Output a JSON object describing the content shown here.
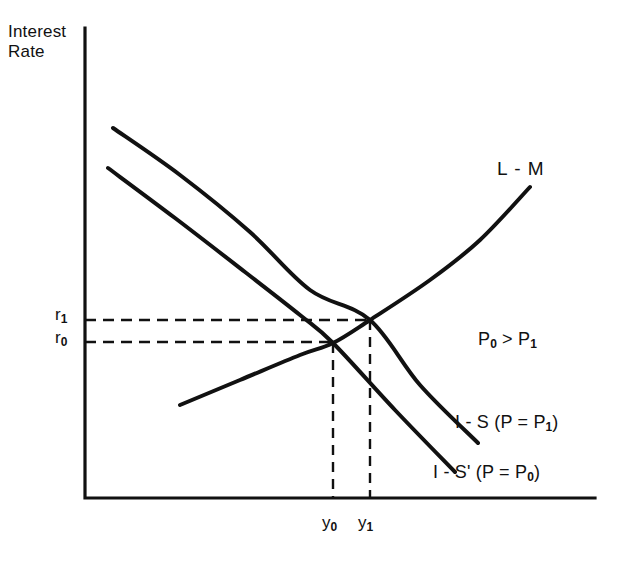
{
  "figure": {
    "background_color": "#ffffff",
    "ink_color": "#111111",
    "width": 619,
    "height": 563
  },
  "axes": {
    "y_axis_label_line1": "Interest",
    "y_axis_label_line2": "Rate",
    "x_axis_label": "",
    "origin": [
      85,
      498
    ],
    "y_axis_top": 28,
    "x_axis_right": 595
  },
  "ticks": {
    "y": [
      {
        "name": "r1",
        "base": "r",
        "sub": "1",
        "value_y_px": 320
      },
      {
        "name": "r0",
        "base": "r",
        "sub": "0",
        "value_y_px": 342
      }
    ],
    "x": [
      {
        "name": "y0",
        "base": "y",
        "sub": "0",
        "value_x_px": 333
      },
      {
        "name": "y1",
        "base": "y",
        "sub": "1",
        "value_x_px": 370
      }
    ]
  },
  "curve_labels": {
    "lm": "L - M",
    "is_p1_prefix": "I - S  (P = P",
    "is_p1_sub": "1",
    "is_p1_suffix": ")",
    "is_p0_prefix": "I - S'  (P = P",
    "is_p0_sub": "0",
    "is_p0_suffix": ")"
  },
  "annotation": {
    "inequality_prefix": "P",
    "inequality_sub_left": "0",
    "inequality_operator": " > P",
    "inequality_sub_right": "1"
  },
  "chart_data": {
    "type": "line",
    "title": "",
    "xlabel": "",
    "ylabel": "Interest Rate",
    "grid": false,
    "legend": "inline-curve-labels",
    "axis_style": "open-L (left and bottom spines only, no tick numbers)",
    "units": "schematic / unlabeled axes",
    "xlim_px": [
      85,
      595
    ],
    "ylim_px": [
      498,
      28
    ],
    "series": [
      {
        "name": "I - S (P = P1)",
        "label": "I-S (P=P₁)",
        "description": "downward-sloping IS schedule for the lower price level P1, lying above and to the right of I-S'",
        "points_px": [
          [
            113,
            128
          ],
          [
            180,
            175
          ],
          [
            250,
            232
          ],
          [
            310,
            290
          ],
          [
            370,
            320
          ],
          [
            420,
            385
          ],
          [
            478,
            443
          ]
        ],
        "stroke_width": 4
      },
      {
        "name": "I - S' (P = P0)",
        "label": "I-S' (P=P₀)",
        "description": "downward-sloping IS schedule for the higher price level P0, lying below and to the left of I-S",
        "points_px": [
          [
            108,
            168
          ],
          [
            175,
            218
          ],
          [
            245,
            272
          ],
          [
            300,
            315
          ],
          [
            333,
            343
          ],
          [
            395,
            410
          ],
          [
            455,
            472
          ]
        ],
        "stroke_width": 4
      },
      {
        "name": "L - M",
        "label": "L-M",
        "description": "upward-sloping LM schedule, steepening as income rises",
        "points_px": [
          [
            180,
            405
          ],
          [
            240,
            380
          ],
          [
            300,
            355
          ],
          [
            333,
            343
          ],
          [
            370,
            320
          ],
          [
            430,
            280
          ],
          [
            480,
            240
          ],
          [
            530,
            187
          ]
        ],
        "stroke_width": 4
      }
    ],
    "equilibria": [
      {
        "name": "E0",
        "x_px": 333,
        "y_px": 343,
        "x_label": "y₀",
        "y_label": "r₀",
        "curves": [
          "I - S' (P = P0)",
          "L - M"
        ]
      },
      {
        "name": "E1",
        "x_px": 370,
        "y_px": 320,
        "x_label": "y₁",
        "y_label": "r₁",
        "curves": [
          "I - S (P = P1)",
          "L - M"
        ]
      }
    ],
    "guide_lines": [
      {
        "orientation": "horizontal",
        "from_px": [
          85,
          320
        ],
        "to_px": [
          370,
          320
        ],
        "style": "dashed",
        "label": "r1"
      },
      {
        "orientation": "horizontal",
        "from_px": [
          85,
          342
        ],
        "to_px": [
          333,
          342
        ],
        "style": "dashed",
        "label": "r0"
      },
      {
        "orientation": "vertical",
        "from_px": [
          333,
          343
        ],
        "to_px": [
          333,
          498
        ],
        "style": "dashed",
        "label": "y0"
      },
      {
        "orientation": "vertical",
        "from_px": [
          370,
          320
        ],
        "to_px": [
          370,
          498
        ],
        "style": "dashed",
        "label": "y1"
      }
    ],
    "annotations": [
      {
        "text": "P₀ > P₁",
        "x_px": 478,
        "y_px": 341
      }
    ]
  }
}
